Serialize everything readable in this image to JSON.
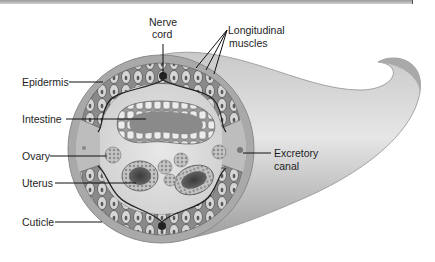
{
  "figure": {
    "labels": {
      "nerve_cord_1": "Nerve",
      "nerve_cord_2": "cord",
      "longitudinal_1": "Longitudinal",
      "longitudinal_2": "muscles",
      "epidermis": "Epidermis",
      "intestine": "Intestine",
      "ovary": "Ovary",
      "uterus": "Uterus",
      "cuticle": "Cuticle",
      "excretory_1": "Excretory",
      "excretory_2": "canal"
    },
    "colors": {
      "body_gray": "#b5b5b5",
      "cuticle_gray": "#a8a8a8",
      "interior": "#dcdcdc",
      "muscle_dark": "#6e6e6e",
      "label_text": "#1e1e1e",
      "leader_line": "#111111"
    }
  }
}
